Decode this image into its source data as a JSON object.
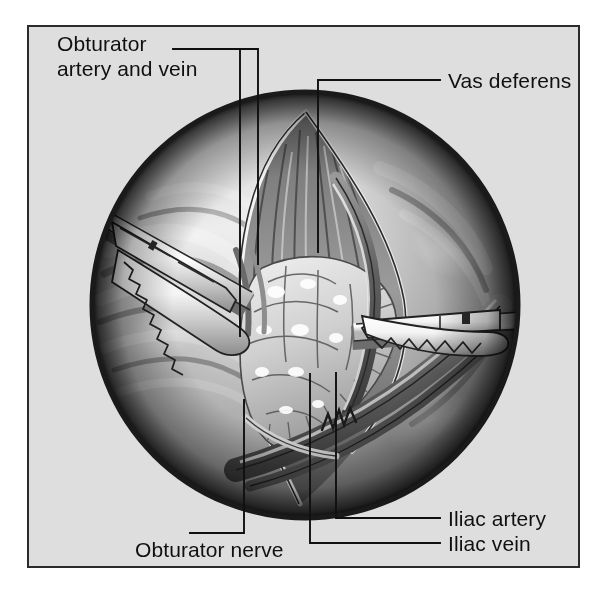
{
  "figure": {
    "view_shape": "circle",
    "background_color": "#dedede",
    "frame_border_color": "#2b2b2b",
    "ink_color": "#101010"
  },
  "labels": [
    {
      "id": "obturator-artery-and-vein",
      "line1": "Obturator",
      "line2": "artery and vein",
      "text": "Obturator artery and vein",
      "position": "top-left",
      "leader_count": 2
    },
    {
      "id": "vas-deferens",
      "text": "Vas deferens",
      "position": "top-right",
      "leader_count": 1
    },
    {
      "id": "iliac-artery",
      "text": "Iliac artery",
      "position": "bottom-right",
      "leader_count": 1
    },
    {
      "id": "iliac-vein",
      "text": "Iliac vein",
      "position": "bottom-right",
      "leader_count": 1
    },
    {
      "id": "obturator-nerve",
      "text": "Obturator nerve",
      "position": "bottom-left",
      "leader_count": 1
    }
  ],
  "anatomy": [
    {
      "name": "obturator-artery",
      "label_ref": "obturator-artery-and-vein"
    },
    {
      "name": "obturator-vein",
      "label_ref": "obturator-artery-and-vein"
    },
    {
      "name": "vas-deferens",
      "label_ref": "vas-deferens"
    },
    {
      "name": "iliac-artery",
      "label_ref": "iliac-artery"
    },
    {
      "name": "iliac-vein",
      "label_ref": "iliac-vein"
    },
    {
      "name": "obturator-nerve",
      "label_ref": "obturator-nerve"
    },
    {
      "name": "lymph-node-packet",
      "label_ref": null
    },
    {
      "name": "pelvic-sidewall-muscle",
      "label_ref": null
    }
  ],
  "instruments": [
    {
      "name": "laparoscopic-grasper-left",
      "entry": "upper-left",
      "jaw": "serrated"
    },
    {
      "name": "laparoscopic-grasper-right",
      "entry": "right",
      "jaw": "serrated"
    }
  ]
}
